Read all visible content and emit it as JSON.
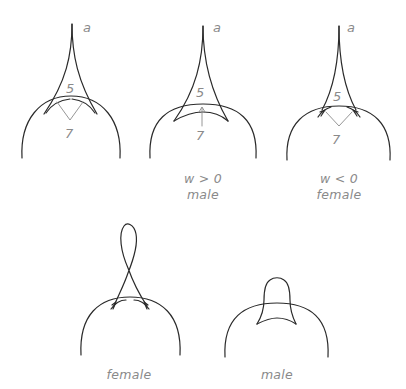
{
  "figures": [
    {
      "id": "fig1",
      "labels": {
        "top": "a",
        "upper": "5",
        "lower": "7"
      },
      "caption": []
    },
    {
      "id": "fig2",
      "labels": {
        "top": "a",
        "upper": "5",
        "lower": "7"
      },
      "caption": [
        "w > 0",
        "male"
      ]
    },
    {
      "id": "fig3",
      "labels": {
        "top": "a",
        "upper": "5",
        "lower": "7"
      },
      "caption": [
        "w < 0",
        "female"
      ]
    },
    {
      "id": "fig4",
      "labels": {},
      "caption": [
        "female"
      ]
    },
    {
      "id": "fig5",
      "labels": {},
      "caption": [
        "male"
      ]
    }
  ],
  "colors": {
    "ink": "#2a2a2a",
    "annotation": "#8a8a8a",
    "background": "#ffffff"
  }
}
